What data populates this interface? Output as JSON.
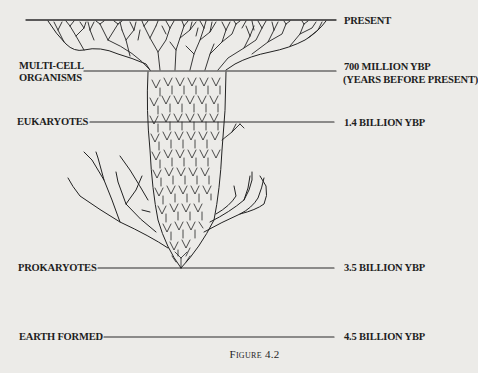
{
  "figure": {
    "caption": "Figure 4.2",
    "left_labels": {
      "multicell_line1": "MULTI-CELL",
      "multicell_line2": "ORGANISMS",
      "eukaryotes": "EUKARYOTES",
      "prokaryotes": "PROKARYOTES",
      "earth_formed": "EARTH FORMED"
    },
    "right_labels": {
      "present": "PRESENT",
      "multicell_time_line1": "700 MILLION YBP",
      "multicell_time_line2": "(YEARS BEFORE PRESENT)",
      "eukaryotes_time": "1.4 BILLION YBP",
      "prokaryotes_time": "3.5 BILLION YBP",
      "earth_formed_time": "4.5 BILLION YBP"
    },
    "colors": {
      "background": "#ecebe8",
      "ink": "#1e1e1e"
    }
  }
}
